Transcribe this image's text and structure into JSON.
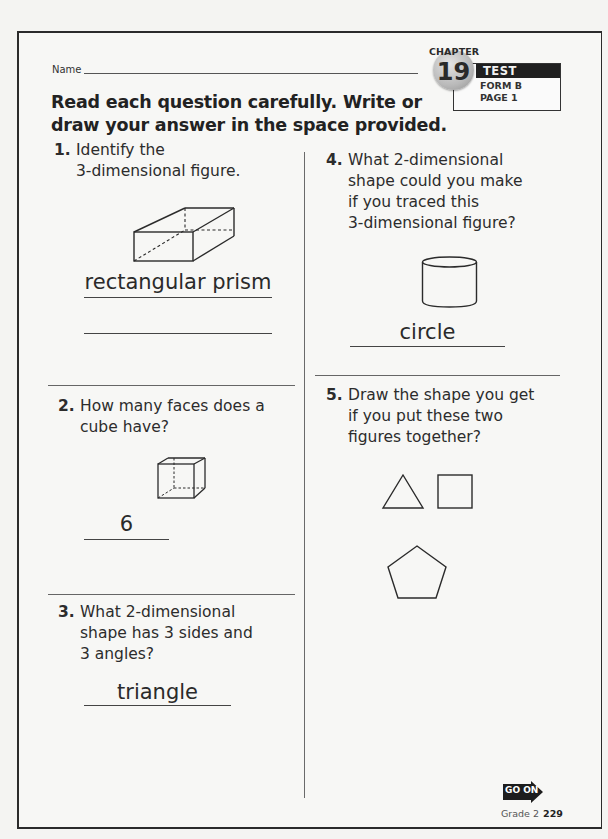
{
  "header": {
    "name_label": "Name",
    "instructions_line1": "Read each question carefully. Write or",
    "instructions_line2": "draw your answer in the space provided.",
    "badge": {
      "chapter_label": "CHAPTER",
      "chapter_number": "19",
      "test_label": "TEST",
      "form_label": "FORM B",
      "page_label": "PAGE 1"
    }
  },
  "questions": [
    {
      "number": "1.",
      "lines": [
        "Identify the",
        "3-dimensional figure."
      ],
      "figure": "rectangular-prism",
      "answer": "rectangular prism"
    },
    {
      "number": "2.",
      "lines": [
        "How many faces does a",
        "cube have?"
      ],
      "figure": "cube",
      "answer": "6"
    },
    {
      "number": "3.",
      "lines": [
        "What 2-dimensional",
        "shape has 3 sides and",
        "3 angles?"
      ],
      "figure": "",
      "answer": "triangle"
    },
    {
      "number": "4.",
      "lines": [
        "What 2-dimensional",
        "shape could you make",
        "if you traced this",
        "3-dimensional figure?"
      ],
      "figure": "cylinder",
      "answer": "circle"
    },
    {
      "number": "5.",
      "lines": [
        "Draw the shape you get",
        "if you put these two",
        "figures together?"
      ],
      "figures": [
        "triangle",
        "square"
      ],
      "answer_drawing": "pentagon"
    }
  ],
  "footer": {
    "go_on_label": "GO ON",
    "grade_label": "Grade 2",
    "page_number": "229"
  }
}
